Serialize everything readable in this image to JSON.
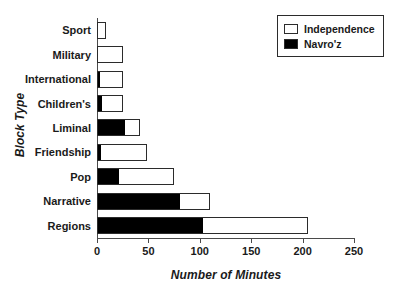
{
  "chart_data": {
    "type": "bar",
    "orientation": "horizontal",
    "stacked": true,
    "title": "",
    "xlabel": "Number of Minutes",
    "ylabel": "Block Type",
    "xlim": [
      0,
      250
    ],
    "xticks": [
      0,
      50,
      100,
      150,
      200,
      250
    ],
    "xtick_labels": [
      "0",
      "50",
      "100",
      "150",
      "200",
      "250"
    ],
    "grid": false,
    "legend_position": "top-right",
    "categories": [
      "Sport",
      "Military",
      "International",
      "Children's",
      "Liminal",
      "Friendship",
      "Pop",
      "Narrative",
      "Regions"
    ],
    "series": [
      {
        "name": "Navro'z",
        "color": "#000000",
        "values": [
          0,
          0,
          1.5,
          4,
          26,
          3,
          20,
          80,
          102
        ]
      },
      {
        "name": "Independence",
        "color": "#ffffff",
        "values": [
          9,
          25,
          23.5,
          21,
          16,
          46,
          55,
          30,
          103
        ]
      }
    ],
    "totals": [
      9,
      25,
      25,
      25,
      42,
      49,
      75,
      110,
      205
    ]
  },
  "legend": {
    "items": [
      {
        "label": "Independence",
        "swatch": "hollow"
      },
      {
        "label": "Navro'z",
        "swatch": "filled"
      }
    ]
  },
  "colors": {
    "navroz": "#000000",
    "independence": "#ffffff",
    "outline": "#2b2b2b",
    "axis": "#4a4a4a",
    "text": "#1a1a1a",
    "background": "#ffffff"
  }
}
